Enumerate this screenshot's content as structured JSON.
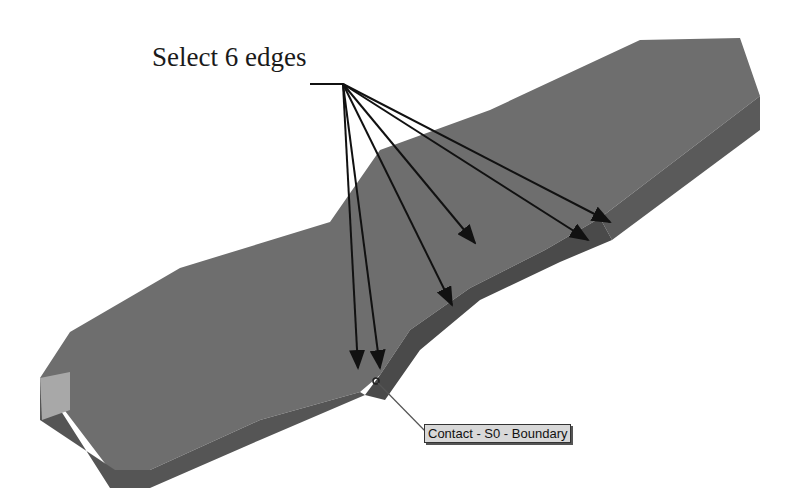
{
  "annotation": {
    "callout_label": "Select 6 edges",
    "arrow_count": 6
  },
  "model": {
    "part": "bone-shaped plate with curved fillet cut",
    "colors": {
      "top_face": "#6e6e6e",
      "side_face": "#575757",
      "end_face": "#a8a8a8",
      "inner_face": "#4a4a4a",
      "leader": "#111111"
    }
  },
  "tooltip": {
    "label": "Contact - S0 - Boundary"
  }
}
